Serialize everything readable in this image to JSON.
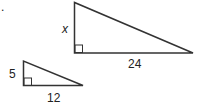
{
  "diagram": {
    "marker": ".",
    "large_triangle": {
      "vertical_leg": "x",
      "horizontal_leg": "24"
    },
    "small_triangle": {
      "vertical_leg": "5",
      "horizontal_leg": "12"
    }
  }
}
